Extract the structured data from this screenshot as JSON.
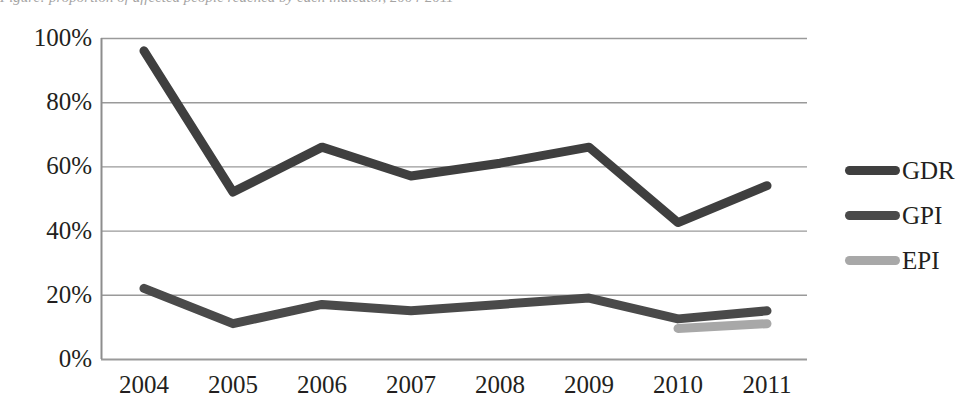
{
  "caption": {
    "text": "Figure: proportion of affected people reached by each indicator, 2004-2011"
  },
  "chart_data": {
    "type": "line",
    "title": "",
    "xlabel": "",
    "ylabel": "",
    "categories": [
      "2004",
      "2005",
      "2006",
      "2007",
      "2008",
      "2009",
      "2010",
      "2011"
    ],
    "ylim": [
      0,
      100
    ],
    "yticks": [
      "0%",
      "20%",
      "40%",
      "60%",
      "80%",
      "100%"
    ],
    "ytick_values": [
      0,
      20,
      40,
      60,
      80,
      100
    ],
    "grid": true,
    "legend_position": "right",
    "value_suffix": "%",
    "series": [
      {
        "name": "GDR",
        "color": "#3f3f3f",
        "x": [
          "2004",
          "2005",
          "2006",
          "2007",
          "2008",
          "2009",
          "2010",
          "2011"
        ],
        "values": [
          96,
          52,
          66,
          57,
          61,
          66,
          42.5,
          54
        ]
      },
      {
        "name": "GPI",
        "color": "#4a4a4a",
        "x": [
          "2004",
          "2005",
          "2006",
          "2007",
          "2008",
          "2009",
          "2010",
          "2011"
        ],
        "values": [
          22,
          11,
          17,
          15,
          17,
          19,
          12.5,
          15
        ]
      },
      {
        "name": "EPI",
        "color": "#a8a8a8",
        "x": [
          "2010",
          "2011"
        ],
        "values": [
          9.5,
          11
        ]
      }
    ]
  },
  "legend": {
    "items": [
      {
        "label": "GDR",
        "color": "#3f3f3f"
      },
      {
        "label": "GPI",
        "color": "#4a4a4a"
      },
      {
        "label": "EPI",
        "color": "#a8a8a8"
      }
    ]
  },
  "axes": {
    "y_labels": [
      "100%",
      "80%",
      "60%",
      "40%",
      "20%",
      "0%"
    ],
    "x_labels": [
      "2004",
      "2005",
      "2006",
      "2007",
      "2008",
      "2009",
      "2010",
      "2011"
    ]
  },
  "style": {
    "axis_color": "#8d8d8d",
    "grid_color": "#9a9a9a",
    "text_color": "#231f20",
    "background": "#ffffff"
  }
}
